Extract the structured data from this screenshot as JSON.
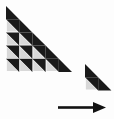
{
  "canvas": {
    "width": 114,
    "height": 119,
    "background_color": "#fdfdfd"
  },
  "palette": {
    "dark": "#1a1a1a",
    "light": "#d8d8d8",
    "separator": "#ffffff",
    "arrow": "#121212",
    "background": "#fdfdfd"
  },
  "shapes": {
    "large_triangle": {
      "name": "large-staircase-triangle",
      "rows": 5,
      "cell_size": 13.2,
      "origin_x": 6,
      "origin_y": 6,
      "orientation": "right-angle-bottom-left",
      "row_cell_counts": [
        1,
        2,
        3,
        4,
        5
      ],
      "total_cells": 15,
      "cell_fill_dark": "#1a1a1a",
      "cell_fill_light": "#d8d8d8"
    },
    "small_triangle": {
      "name": "small-staircase-triangle",
      "rows": 2,
      "cell_size": 13.2,
      "origin_x": 85,
      "origin_y": 64,
      "orientation": "right-angle-bottom-left",
      "row_cell_counts": [
        1,
        2
      ],
      "total_cells": 3,
      "cell_fill_dark": "#1a1a1a",
      "cell_fill_light": "#d8d8d8"
    },
    "arrow": {
      "name": "right-arrow",
      "direction": "right",
      "shaft_x1": 58,
      "shaft_x2": 96,
      "shaft_y": 107.5,
      "shaft_thickness": 2.6,
      "head_tip_x": 106,
      "head_back_x": 93,
      "head_half_height": 5.6,
      "color": "#121212"
    }
  }
}
